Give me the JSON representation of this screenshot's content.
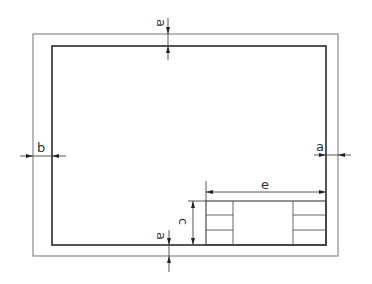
{
  "diagram": {
    "colors": {
      "background": "#ffffff",
      "outer_frame": "#8a8a8a",
      "inner_frame": "#2a2a2a",
      "lines": "#444444"
    },
    "sheet": {
      "outer_frame": {
        "x": 33,
        "y": 34,
        "width": 305,
        "height": 222
      },
      "inner_frame": {
        "x": 52,
        "y": 46,
        "width": 274,
        "height": 199
      }
    },
    "title_block": {
      "x": 206,
      "y": 201,
      "width": 120,
      "height": 44,
      "left_column_width": 27,
      "right_column_x": 293,
      "left_rows": 3,
      "right_rows": 3
    },
    "dimensions": {
      "top_margin": {
        "label": "a"
      },
      "bottom_margin": {
        "label": "a"
      },
      "left_margin": {
        "label": "b"
      },
      "right_margin": {
        "label": "a"
      },
      "title_block_height": {
        "label": "c"
      },
      "title_block_width": {
        "label": "e"
      }
    }
  }
}
